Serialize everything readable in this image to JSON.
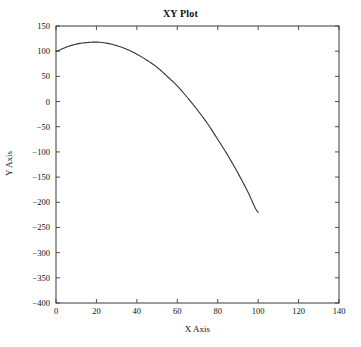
{
  "figure": {
    "background_color": "#ffffff",
    "width": 361,
    "height": 347
  },
  "chart_data": {
    "type": "line",
    "title": "XY Plot",
    "xlabel": "X Axis",
    "ylabel": "Y Axis",
    "xlim": [
      0,
      140
    ],
    "ylim": [
      -400,
      150
    ],
    "xticks": [
      0,
      20,
      40,
      60,
      80,
      100,
      120,
      140
    ],
    "yticks": [
      150,
      100,
      50,
      0,
      -50,
      -100,
      -150,
      -200,
      -250,
      -300,
      -350,
      -400
    ],
    "xtick_labels": [
      "0",
      "20",
      "40",
      "60",
      "80",
      "100",
      "120",
      "140"
    ],
    "ytick_labels": [
      "150",
      "100",
      "50",
      "0",
      "−50",
      "−100",
      "−150",
      "−200",
      "−250",
      "−300",
      "−350",
      "−400"
    ],
    "grid": false,
    "legend": null,
    "tick_direction": "in",
    "frame": true,
    "line_color": "#333333",
    "line_width": 1,
    "series": [
      {
        "name": "trajectory",
        "x": [
          0,
          5,
          10,
          15,
          20,
          25,
          30,
          35,
          40,
          45,
          50,
          55,
          60,
          65,
          70,
          75,
          80,
          85,
          90,
          95,
          100
        ],
        "y": [
          100,
          108,
          114,
          117,
          118,
          116,
          111,
          104,
          94,
          82,
          68,
          50,
          31,
          8,
          -17,
          -44,
          -75,
          -107,
          -142,
          -180,
          -220
        ]
      }
    ]
  },
  "axes": {
    "x_axis_label": "X Axis",
    "y_axis_label": "Y Axis"
  }
}
